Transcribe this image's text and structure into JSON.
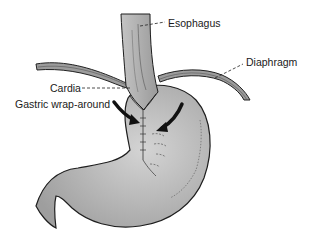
{
  "diagram": {
    "type": "anatomical-illustration",
    "labels": {
      "esophagus": "Esophagus",
      "diaphragm": "Diaphragm",
      "cardia": "Cardia",
      "gastric_wrap": "Gastric wrap-around"
    },
    "colors": {
      "organ_fill": "#b4b4b4",
      "organ_light": "#d2d2d2",
      "outline": "#1e1e1e",
      "arrow": "#111111"
    }
  }
}
